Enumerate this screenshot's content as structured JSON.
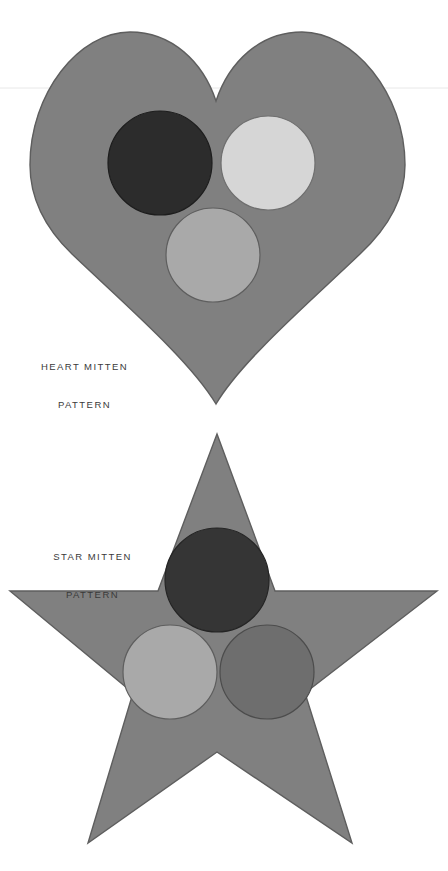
{
  "page": {
    "width": 448,
    "height": 871,
    "background_color": "#ffffff",
    "divider_rule": {
      "name": "horizontal-hairline",
      "y": 88,
      "color": "#e8e8e8"
    }
  },
  "figures": [
    {
      "id": "heart-mitten",
      "shape": "heart",
      "label_line1": "HEART MITTEN",
      "label_line2": "PATTERN",
      "body_fill": "#808080",
      "body_stroke": "#5e5e5e",
      "circles": [
        {
          "name": "dark-circle",
          "fill": "#2c2c2c",
          "stroke": "#1d1d1d",
          "cx": 160,
          "cy": 163,
          "r": 52
        },
        {
          "name": "light-circle",
          "fill": "#d6d6d6",
          "stroke": "#6f6f6f",
          "cx": 268,
          "cy": 163,
          "r": 47
        },
        {
          "name": "medium-circle",
          "fill": "#a9a9a9",
          "stroke": "#5e5e5e",
          "cx": 213,
          "cy": 255,
          "r": 47
        }
      ]
    },
    {
      "id": "star-mitten",
      "shape": "star",
      "label_line1": "STAR MITTEN",
      "label_line2": "PATTERN",
      "body_fill": "#808080",
      "body_stroke": "#5e5e5e",
      "circles": [
        {
          "name": "dark-circle",
          "fill": "#353535",
          "stroke": "#242424",
          "cx": 217,
          "cy": 580,
          "r": 52
        },
        {
          "name": "light-circle",
          "fill": "#a9a9a9",
          "stroke": "#5e5e5e",
          "cx": 170,
          "cy": 672,
          "r": 47
        },
        {
          "name": "shadow-circle",
          "fill": "#6e6e6e",
          "stroke": "#4c4c4c",
          "cx": 267,
          "cy": 672,
          "r": 47
        }
      ]
    }
  ]
}
